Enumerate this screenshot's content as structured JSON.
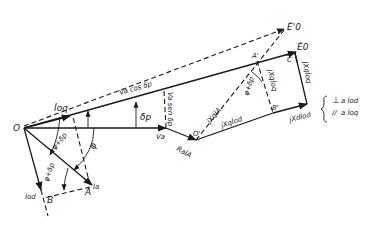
{
  "diagram": {
    "type": "phasor-diagram",
    "points": {
      "O": "O",
      "O_prime": "O'",
      "A": "A",
      "A_prime": "A'",
      "B": "B",
      "B_prime": "B'",
      "C": "C"
    },
    "phasors": {
      "Va": "V̇a",
      "Ra_Ia": "RaİA",
      "E0": "Ė0",
      "E0_prime": "Ė'0",
      "Ia": "İa",
      "Ioq": "İoq",
      "Iod": "İod",
      "jXq_Ia": "jXqİA",
      "jXq_Iod": "jXqİod",
      "jXd_Iod": "jXdİod",
      "jXq_Ioq": "jXqİoq",
      "jXq_Ioq_2": "jXqİoq"
    },
    "segments": {
      "Va_cos": "Va cos δp",
      "Va_sin": "Va sen δp"
    },
    "angles": {
      "delta_p": "δp",
      "phi": "φ",
      "phi_plus_delta_outer": "φ+δp",
      "phi_plus_delta_inner": "φ+δp",
      "phi_plus_delta_right": "φ+δp"
    },
    "legend": {
      "line1_symbol": "⊥",
      "line1_text": "a İod",
      "line2_symbol": "//",
      "line2_text": "a İoq"
    }
  }
}
